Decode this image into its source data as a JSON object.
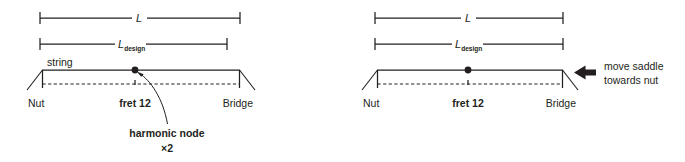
{
  "figure": {
    "type": "technical-diagram",
    "panels": [
      {
        "id": "before",
        "dimension_lines": [
          {
            "name": "L",
            "label": "L",
            "subscript": "",
            "x1": 40,
            "x2": 240,
            "y": 18,
            "label_x": 139
          },
          {
            "name": "Ldesign",
            "label": "L",
            "subscript": "design",
            "x1": 40,
            "x2": 227,
            "y": 44,
            "label_x": 123
          }
        ],
        "string": {
          "nut_x": 42,
          "bridge_x": 240,
          "string_y": 70,
          "fret_y": 84,
          "node_x": 135
        },
        "labels": {
          "string": "string",
          "nut": "Nut",
          "fret": "fret 12",
          "bridge": "Bridge"
        },
        "callout": {
          "line1": "harmonic node",
          "line2": "×2"
        }
      },
      {
        "id": "after",
        "dimension_lines": [
          {
            "name": "L",
            "label": "L",
            "subscript": "",
            "x1": 375,
            "x2": 563,
            "y": 18,
            "label_x": 468
          },
          {
            "name": "Ldesign",
            "label": "L",
            "subscript": "design",
            "x1": 375,
            "x2": 563,
            "y": 44,
            "label_x": 460
          }
        ],
        "string": {
          "nut_x": 377,
          "bridge_x": 563,
          "string_y": 70,
          "fret_y": 84,
          "node_x": 468
        },
        "labels": {
          "string": "",
          "nut": "Nut",
          "fret": "fret 12",
          "bridge": "Bridge"
        },
        "callout": {
          "line1": "move saddle",
          "line2": "towards nut"
        }
      }
    ],
    "colors": {
      "ink": "#231f20",
      "background": "#ffffff"
    }
  }
}
